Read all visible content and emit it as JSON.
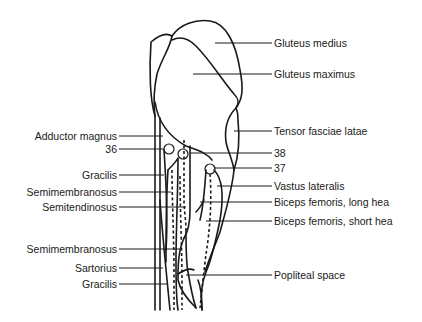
{
  "figure": {
    "line_color": "#1a1a1a",
    "background": "#ffffff"
  },
  "labels_right": [
    {
      "id": "gluteus-medius",
      "text": "Gluteus medius"
    },
    {
      "id": "gluteus-maximus",
      "text": "Gluteus maximus"
    },
    {
      "id": "tensor-fasciae-latae",
      "text": "Tensor fasciae latae"
    },
    {
      "id": "num-38",
      "text": "38"
    },
    {
      "id": "num-37",
      "text": "37"
    },
    {
      "id": "vastus-lateralis",
      "text": "Vastus lateralis"
    },
    {
      "id": "biceps-femoris-long",
      "text": "Biceps femoris, long hea"
    },
    {
      "id": "biceps-femoris-short",
      "text": "Biceps femoris, short hea"
    },
    {
      "id": "popliteal-space",
      "text": "Popliteal space"
    }
  ],
  "labels_left": [
    {
      "id": "adductor-magnus",
      "text": "Adductor magnus"
    },
    {
      "id": "num-36",
      "text": "36"
    },
    {
      "id": "gracilis-upper",
      "text": "Gracilis"
    },
    {
      "id": "semimembranosus-upper",
      "text": "Semimembranosus"
    },
    {
      "id": "semitendinosus",
      "text": "Semitendinosus"
    },
    {
      "id": "semimembranosus-lower",
      "text": "Semimembranosus"
    },
    {
      "id": "sartorius",
      "text": "Sartorius"
    },
    {
      "id": "gracilis-lower",
      "text": "Gracilis"
    }
  ]
}
